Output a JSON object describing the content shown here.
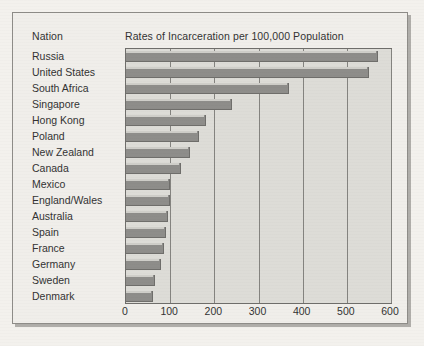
{
  "figure": {
    "nation_header": "Nation",
    "title": "Rates of Incarceration per 100,000 Population"
  },
  "colors": {
    "page_background": "#f3f1ed",
    "frame_background": "#f0eeea",
    "frame_border": "#8e8c88",
    "plot_background": "#dddcd7",
    "plot_border": "#6f6e6b",
    "bar_fill": "#8e8d8a",
    "bar_highlight": "#cfcec9",
    "gridline": "#84837f",
    "text": "#333333"
  },
  "chart_data": {
    "type": "bar",
    "orientation": "horizontal",
    "title": "Rates of Incarceration per 100,000 Population",
    "xlabel": "",
    "ylabel": "Nation",
    "xlim": [
      0,
      600
    ],
    "xticks": [
      0,
      100,
      200,
      300,
      400,
      500,
      600
    ],
    "xtick_labels": [
      "0",
      "100",
      "200",
      "300",
      "400",
      "500",
      "600"
    ],
    "grid": "vertical",
    "legend": "none",
    "categories": [
      "Russia",
      "United States",
      "South Africa",
      "Singapore",
      "Hong Kong",
      "Poland",
      "New Zealand",
      "Canada",
      "Mexico",
      "England/Wales",
      "Australia",
      "Spain",
      "France",
      "Germany",
      "Sweden",
      "Denmark"
    ],
    "values": [
      570,
      550,
      370,
      240,
      180,
      165,
      145,
      125,
      100,
      100,
      95,
      90,
      85,
      80,
      65,
      62
    ]
  }
}
